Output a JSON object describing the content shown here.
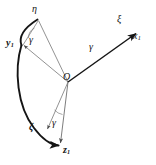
{
  "figure": {
    "kind": "geometry-diagram",
    "background_color": "#ffffff",
    "stroke_color": "#151515",
    "thin_stroke_color": "#6e6e6e",
    "origin_label": "O",
    "labels": {
      "eta": "η",
      "y1_base": "y",
      "y1_sub": "1",
      "xi": "ξ",
      "x1_base": "x",
      "x1_sub": "1",
      "zeta": "ζ",
      "z1_base": "z",
      "z1_sub": "1",
      "gamma_upper": "γ",
      "gamma_middle": "γ",
      "gamma_lower": "γ"
    },
    "points": {
      "O": [
        68,
        82
      ],
      "eta_tip": [
        37,
        18
      ],
      "y1_tip": [
        21,
        45
      ],
      "xi_tip": [
        138,
        32
      ],
      "zeta_tip": [
        46,
        131
      ],
      "z1_tip": [
        60,
        146
      ]
    },
    "angles": [
      {
        "name": "gamma-upper",
        "label": "γ",
        "between": [
          "eta",
          "y1"
        ]
      },
      {
        "name": "gamma-middle",
        "label": "γ",
        "between": [
          "xi",
          "x1"
        ]
      },
      {
        "name": "gamma-lower",
        "label": "γ",
        "between": [
          "zeta",
          "z1"
        ]
      }
    ],
    "arc": {
      "name": "great-circle-arc",
      "from": "eta_tip",
      "through": "y1_tip",
      "to": "z1_tip",
      "style": "bold"
    }
  }
}
